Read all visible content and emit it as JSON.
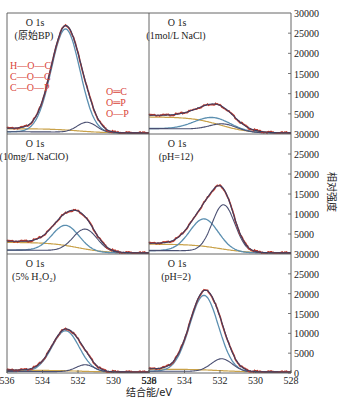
{
  "chart_data": {
    "type": "line",
    "title": "",
    "xlabel": "结合能/eV",
    "ylabel": "相对强度",
    "xlim": [
      536,
      528
    ],
    "x_ticks": [
      "536",
      "534",
      "532",
      "530",
      "528"
    ],
    "ylim": [
      0,
      30000
    ],
    "y_ticks_right": [
      "30000",
      "25000",
      "20000",
      "15000",
      "10000",
      "5000",
      "0"
    ],
    "layout": {
      "rows": 3,
      "cols": 2,
      "shared_x": true,
      "y_axis_side": "right",
      "grid": false,
      "legend": "none"
    },
    "series_colors": {
      "raw": "#c0392b",
      "envelope": "#3b3f63",
      "component_C_O": "#5b8fb0",
      "component_O_P": "#4a4f72",
      "background": "#c9a24a"
    },
    "panels": [
      {
        "id": "raw-bp",
        "title": "O 1s",
        "subtitle": "(原始BP)",
        "annotations_left": [
          "H—O—C",
          "C—O—C",
          "C—O—P"
        ],
        "annotations_right": [
          "O═C",
          "O═P",
          "O—P"
        ],
        "peaks": [
          {
            "name": "C-O / H-O-C",
            "center": 532.7,
            "height": 26000,
            "fwhm": 1.9
          },
          {
            "name": "O=C / O=P",
            "center": 531.5,
            "height": 2600,
            "fwhm": 1.3
          }
        ],
        "envelope_max": 26300,
        "baseline_left": 1200,
        "baseline_right": 0
      },
      {
        "id": "nacl",
        "title": "O 1s",
        "subtitle": "(1mol/L NaCl)",
        "peaks": [
          {
            "name": "C-O",
            "center": 532.4,
            "height": 3200,
            "fwhm": 2.4
          },
          {
            "name": "O=P",
            "center": 531.8,
            "height": 1800,
            "fwhm": 1.8
          }
        ],
        "envelope_max": 4300,
        "baseline_left": 4500,
        "baseline_right": 0
      },
      {
        "id": "naclo",
        "title": "O 1s",
        "subtitle": "(10mg/L NaClO)",
        "peaks": [
          {
            "name": "C-O",
            "center": 532.7,
            "height": 6500,
            "fwhm": 1.8
          },
          {
            "name": "O=P",
            "center": 531.6,
            "height": 5800,
            "fwhm": 1.6
          }
        ],
        "envelope_max": 9800,
        "baseline_left": 3000,
        "baseline_right": 0
      },
      {
        "id": "ph12",
        "title": "O 1s",
        "subtitle": "(pH=12)",
        "peaks": [
          {
            "name": "C-O",
            "center": 532.9,
            "height": 8200,
            "fwhm": 1.9
          },
          {
            "name": "O=P",
            "center": 531.8,
            "height": 12000,
            "fwhm": 1.5
          }
        ],
        "envelope_max": 15500,
        "baseline_left": 2500,
        "baseline_right": 0
      },
      {
        "id": "h2o2",
        "title": "O 1s",
        "subtitle": "(5% H₂O₂)",
        "peaks": [
          {
            "name": "C-O",
            "center": 532.7,
            "height": 10500,
            "fwhm": 1.8
          },
          {
            "name": "O=P",
            "center": 531.6,
            "height": 1800,
            "fwhm": 1.2
          }
        ],
        "envelope_max": 11000,
        "baseline_left": 500,
        "baseline_right": 0
      },
      {
        "id": "ph2",
        "title": "O 1s",
        "subtitle": "(pH=2)",
        "peaks": [
          {
            "name": "C-O",
            "center": 532.9,
            "height": 19500,
            "fwhm": 1.9
          },
          {
            "name": "O=P",
            "center": 531.9,
            "height": 3300,
            "fwhm": 1.4
          }
        ],
        "envelope_max": 20500,
        "baseline_left": 800,
        "baseline_right": 0
      }
    ]
  }
}
